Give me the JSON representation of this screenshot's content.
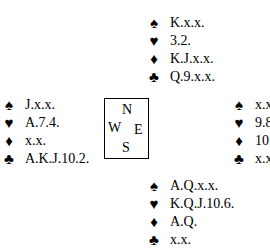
{
  "suits": {
    "spades": "♠",
    "hearts": "♥",
    "diamonds": "♦",
    "clubs": "♣"
  },
  "compass": {
    "north": "N",
    "west": "W",
    "east": "E",
    "south": "S"
  },
  "hands": {
    "north": {
      "spades": "K.x.x.",
      "hearts": "3.2.",
      "diamonds": "K.J.x.x.",
      "clubs": "Q.9.x.x."
    },
    "west": {
      "spades": "J.x.x.",
      "hearts": "A.7.4.",
      "diamonds": "x.x.",
      "clubs": "A.K.J.10.2."
    },
    "east": {
      "spades": "x.x.x.",
      "hearts": "9.8.5.",
      "diamonds": "10.x.x.x.x.",
      "clubs": "x.x."
    },
    "south": {
      "spades": "A.Q.x.x.",
      "hearts": "K.Q.J.10.6.",
      "diamonds": "A.Q.",
      "clubs": "x.x."
    }
  }
}
